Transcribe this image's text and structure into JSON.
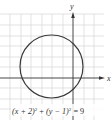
{
  "figure": {
    "type": "circle-graph",
    "equation_label": {
      "lhs1": "(x + 2)",
      "exp1": "2",
      "plus": " + ",
      "lhs2": "(y − 1)",
      "exp2": "2",
      "rhs": " = 9"
    },
    "axes": {
      "x_label": "x",
      "y_label": "y"
    },
    "circle": {
      "center": [
        -2,
        1
      ],
      "radius": 3,
      "stroke_color": "#3a3a3a"
    },
    "grid": {
      "x_range": [
        -7,
        3
      ],
      "y_range": [
        -4,
        6
      ],
      "spacing": 1,
      "line_color": "#d4d4d4"
    },
    "axis_color": "#333333"
  }
}
